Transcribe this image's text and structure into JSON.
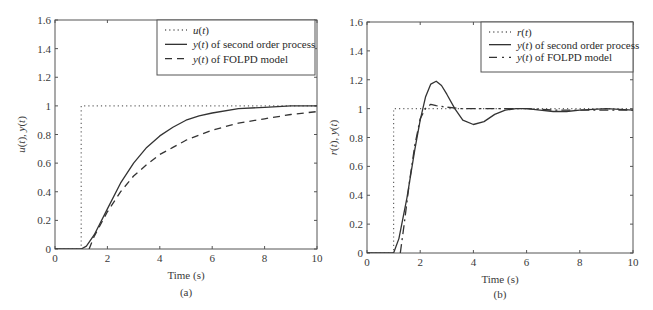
{
  "chart_data": [
    {
      "type": "line",
      "panel_label": "(a)",
      "title": "",
      "xlabel": "Time (s)",
      "ylabel": "u(t), y(t)",
      "xlim": [
        0,
        10
      ],
      "ylim": [
        0,
        1.6
      ],
      "xticks": [
        "0",
        "2",
        "4",
        "6",
        "8",
        "10"
      ],
      "yticks": [
        "0",
        "0.2",
        "0.4",
        "0.6",
        "0.8",
        "1",
        "1.2",
        "1.4",
        "1.6"
      ],
      "grid": false,
      "legend_position": "upper right",
      "legend": [
        "u(t)",
        "y(t) of second order process",
        "y(t) of FOLPD model"
      ],
      "series": [
        {
          "name": "u(t)",
          "style": "dotted",
          "x": [
            0,
            1,
            1,
            10
          ],
          "y": [
            0,
            0,
            1,
            1
          ]
        },
        {
          "name": "y(t) of second order process",
          "style": "solid",
          "x": [
            0,
            1,
            1.2,
            1.5,
            2,
            2.5,
            3,
            3.5,
            4,
            4.5,
            5,
            5.5,
            6,
            7,
            8,
            9,
            10
          ],
          "y": [
            0,
            0,
            0.02,
            0.1,
            0.28,
            0.46,
            0.6,
            0.71,
            0.79,
            0.85,
            0.9,
            0.93,
            0.95,
            0.98,
            0.99,
            1.0,
            1.0
          ]
        },
        {
          "name": "y(t) of FOLPD model",
          "style": "dashed",
          "x": [
            1.3,
            1.5,
            2,
            2.5,
            3,
            3.5,
            4,
            4.5,
            5,
            6,
            7,
            8,
            9,
            10
          ],
          "y": [
            0,
            0.09,
            0.26,
            0.4,
            0.51,
            0.59,
            0.66,
            0.71,
            0.76,
            0.83,
            0.88,
            0.91,
            0.94,
            0.96
          ]
        }
      ]
    },
    {
      "type": "line",
      "panel_label": "(b)",
      "title": "",
      "xlabel": "Time (s)",
      "ylabel": "r(t), y(t)",
      "xlim": [
        0,
        10
      ],
      "ylim": [
        0,
        1.6
      ],
      "xticks": [
        "0",
        "2",
        "4",
        "6",
        "8",
        "10"
      ],
      "yticks": [
        "0",
        "0.2",
        "0.4",
        "0.6",
        "0.8",
        "1",
        "1.2",
        "1.4",
        "1.6"
      ],
      "grid": false,
      "legend_position": "upper right",
      "legend": [
        "r(t)",
        "y(t) of second order process",
        "y(t) of FOLPD model"
      ],
      "series": [
        {
          "name": "r(t)",
          "style": "dotted",
          "x": [
            0,
            1,
            1,
            10
          ],
          "y": [
            0,
            0,
            1,
            1
          ]
        },
        {
          "name": "y(t) of second order process",
          "style": "solid",
          "x": [
            0,
            1,
            1.2,
            1.5,
            1.8,
            2,
            2.2,
            2.4,
            2.6,
            2.8,
            3,
            3.3,
            3.6,
            4,
            4.4,
            4.8,
            5.2,
            5.6,
            6,
            6.5,
            7,
            7.5,
            8,
            9,
            10
          ],
          "y": [
            0,
            0,
            0.1,
            0.38,
            0.72,
            0.92,
            1.08,
            1.17,
            1.19,
            1.16,
            1.1,
            1.0,
            0.92,
            0.89,
            0.91,
            0.96,
            0.99,
            1.0,
            1.0,
            0.99,
            0.98,
            0.98,
            0.99,
            1.0,
            0.99
          ]
        },
        {
          "name": "y(t) of FOLPD model",
          "style": "dashdot",
          "x": [
            1.25,
            1.4,
            1.6,
            1.8,
            2,
            2.2,
            2.4,
            2.6,
            3,
            3.5,
            4,
            5,
            6,
            7,
            8,
            9,
            10
          ],
          "y": [
            0,
            0.2,
            0.5,
            0.75,
            0.93,
            1.0,
            1.03,
            1.02,
            1.01,
            1.0,
            1.0,
            1.0,
            1.0,
            0.99,
            0.99,
            0.99,
            0.99
          ]
        }
      ]
    }
  ]
}
